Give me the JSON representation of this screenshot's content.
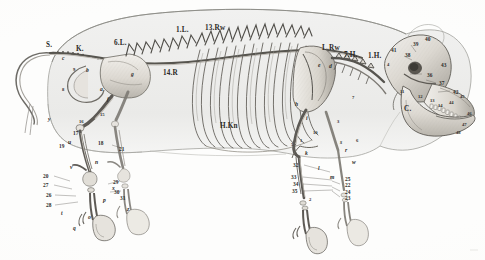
{
  "figure": {
    "type": "anatomical-engraving",
    "orientation": "left-lateral, head to the right",
    "style": "monochrome steel engraving, hatched shading, pale grey body silhouette",
    "palette": {
      "paper": "#fdfdfc",
      "body_silhouette": "#ececeb",
      "body_outline": "#9a9a96",
      "bone_fill": "#e3e1dc",
      "bone_shadow": "#a9a69f",
      "ink": "#2b2a28",
      "hatching": "#6f6d68"
    }
  },
  "labels": {
    "major": [
      {
        "text": "S.",
        "x": 46,
        "y": 42,
        "note": "Schwanzwirbel / caudal vertebrae"
      },
      {
        "text": "K.",
        "x": 76,
        "y": 46,
        "note": "Kreuzbein / sacrum"
      },
      {
        "text": "6.L.",
        "x": 114,
        "y": 40,
        "note": "6th lumbar vertebra"
      },
      {
        "text": "1.L.",
        "x": 176,
        "y": 27,
        "note": "1st lumbar vertebra"
      },
      {
        "text": "13.Rw",
        "x": 205,
        "y": 25,
        "note": "13th rib vertebra"
      },
      {
        "text": "14.R",
        "x": 163,
        "y": 70,
        "note": "14th rib"
      },
      {
        "text": "H.Kn",
        "x": 220,
        "y": 123,
        "note": "Hüftknochen / rib cage reference"
      },
      {
        "text": "L.Rw",
        "x": 322,
        "y": 45,
        "note": "last rib vertebra"
      },
      {
        "text": "7.H.",
        "x": 344,
        "y": 52,
        "note": "7th cervical vertebra"
      },
      {
        "text": "1.H.",
        "x": 368,
        "y": 53,
        "note": "1st cervical vertebra / atlas"
      },
      {
        "text": "C.",
        "x": 404,
        "y": 106,
        "note": "Mandible / lower jaw"
      }
    ],
    "italic_small": [
      {
        "text": "a",
        "x": 100,
        "y": 87
      },
      {
        "text": "b",
        "x": 86,
        "y": 68
      },
      {
        "text": "c",
        "x": 62,
        "y": 56
      },
      {
        "text": "d",
        "x": 329,
        "y": 64
      },
      {
        "text": "e",
        "x": 318,
        "y": 63
      },
      {
        "text": "f",
        "x": 107,
        "y": 97
      },
      {
        "text": "g",
        "x": 131,
        "y": 72
      },
      {
        "text": "h",
        "x": 295,
        "y": 102
      },
      {
        "text": "i",
        "x": 306,
        "y": 116
      },
      {
        "text": "k",
        "x": 305,
        "y": 151
      },
      {
        "text": "l",
        "x": 318,
        "y": 166
      },
      {
        "text": "m",
        "x": 330,
        "y": 175
      },
      {
        "text": "n",
        "x": 95,
        "y": 160
      },
      {
        "text": "o",
        "x": 88,
        "y": 215
      },
      {
        "text": "p",
        "x": 103,
        "y": 198
      },
      {
        "text": "q",
        "x": 73,
        "y": 226
      },
      {
        "text": "r",
        "x": 345,
        "y": 148
      },
      {
        "text": "s",
        "x": 340,
        "y": 140
      },
      {
        "text": "t",
        "x": 61,
        "y": 211
      },
      {
        "text": "u",
        "x": 68,
        "y": 140
      },
      {
        "text": "v",
        "x": 70,
        "y": 165
      },
      {
        "text": "w",
        "x": 352,
        "y": 160
      },
      {
        "text": "x",
        "x": 112,
        "y": 186
      },
      {
        "text": "y",
        "x": 48,
        "y": 117
      },
      {
        "text": "z",
        "x": 127,
        "y": 207
      }
    ],
    "numeric": [
      {
        "text": "17",
        "x": 73,
        "y": 131
      },
      {
        "text": "18",
        "x": 98,
        "y": 141
      },
      {
        "text": "19",
        "x": 59,
        "y": 144
      },
      {
        "text": "20",
        "x": 43,
        "y": 174
      },
      {
        "text": "21",
        "x": 119,
        "y": 147
      },
      {
        "text": "22",
        "x": 345,
        "y": 183
      },
      {
        "text": "23",
        "x": 345,
        "y": 196
      },
      {
        "text": "24",
        "x": 345,
        "y": 190
      },
      {
        "text": "25",
        "x": 345,
        "y": 177
      },
      {
        "text": "26",
        "x": 46,
        "y": 193
      },
      {
        "text": "27",
        "x": 43,
        "y": 183
      },
      {
        "text": "28",
        "x": 46,
        "y": 203
      },
      {
        "text": "29",
        "x": 113,
        "y": 180
      },
      {
        "text": "30",
        "x": 114,
        "y": 190
      },
      {
        "text": "31",
        "x": 120,
        "y": 196
      },
      {
        "text": "32",
        "x": 293,
        "y": 163
      },
      {
        "text": "33",
        "x": 291,
        "y": 175
      },
      {
        "text": "34",
        "x": 293,
        "y": 182
      },
      {
        "text": "35",
        "x": 292,
        "y": 189
      },
      {
        "text": "36",
        "x": 427,
        "y": 73
      },
      {
        "text": "37",
        "x": 439,
        "y": 81
      },
      {
        "text": "38",
        "x": 405,
        "y": 53
      },
      {
        "text": "39",
        "x": 413,
        "y": 42
      },
      {
        "text": "40",
        "x": 425,
        "y": 37
      },
      {
        "text": "41",
        "x": 391,
        "y": 48
      },
      {
        "text": "42",
        "x": 453,
        "y": 90
      },
      {
        "text": "43",
        "x": 441,
        "y": 63
      },
      {
        "text": "44",
        "x": 449,
        "y": 101
      },
      {
        "text": "45",
        "x": 460,
        "y": 95
      },
      {
        "text": "46",
        "x": 467,
        "y": 112
      },
      {
        "text": "47",
        "x": 462,
        "y": 123
      },
      {
        "text": "48",
        "x": 456,
        "y": 131
      },
      {
        "text": "1",
        "x": 300,
        "y": 139
      },
      {
        "text": "2",
        "x": 309,
        "y": 198
      },
      {
        "text": "3",
        "x": 337,
        "y": 120
      },
      {
        "text": "4",
        "x": 387,
        "y": 63
      },
      {
        "text": "5",
        "x": 291,
        "y": 143
      },
      {
        "text": "6",
        "x": 356,
        "y": 139
      },
      {
        "text": "7",
        "x": 352,
        "y": 96
      },
      {
        "text": "8",
        "x": 62,
        "y": 88
      },
      {
        "text": "9",
        "x": 73,
        "y": 68
      },
      {
        "text": "10",
        "x": 313,
        "y": 131
      },
      {
        "text": "11",
        "x": 400,
        "y": 90
      },
      {
        "text": "12",
        "x": 418,
        "y": 95
      },
      {
        "text": "13",
        "x": 430,
        "y": 99
      },
      {
        "text": "14",
        "x": 438,
        "y": 104
      },
      {
        "text": "15",
        "x": 100,
        "y": 113
      },
      {
        "text": "16",
        "x": 79,
        "y": 120
      }
    ]
  }
}
